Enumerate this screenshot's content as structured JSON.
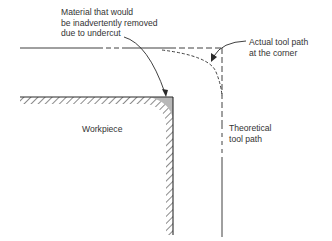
{
  "diagram": {
    "labels": {
      "material_removed": {
        "line1": "Material that would",
        "line2": "be inadvertently removed",
        "line3": "due to undercut"
      },
      "actual_tool_path": {
        "line1": "Actual tool path",
        "line2": "at the corner"
      },
      "workpiece": "Workpiece",
      "theoretical_tool_path": {
        "line1": "Theoretical",
        "line2": "tool path"
      }
    },
    "colors": {
      "line": "#2a2a2a",
      "undercut_fill": "#b8b8b8",
      "text": "#333333"
    }
  }
}
